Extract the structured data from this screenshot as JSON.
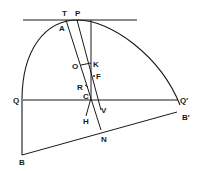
{
  "diagram": {
    "type": "geometry-parabola",
    "colors": {
      "stroke": "#1a1a1a",
      "background": "#ffffff"
    },
    "labels": {
      "T": "T",
      "P": "P",
      "A": "A",
      "O": "O",
      "K": "K",
      "F": "F",
      "R": "R",
      "C": "C",
      "Q": "Q",
      "Q_prime": "Q′",
      "V": "V",
      "H": "H",
      "B_prime": "B′",
      "N": "N",
      "B": "B"
    }
  }
}
